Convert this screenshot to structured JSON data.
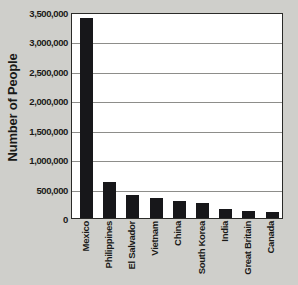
{
  "chart_data": {
    "type": "bar",
    "title": "",
    "xlabel": "",
    "ylabel": "Number of People",
    "categories": [
      "Mexico",
      "Philippines",
      "El Salvador",
      "Vietnam",
      "China",
      "South Korea",
      "India",
      "Great Britain",
      "Canada"
    ],
    "values": [
      3400000,
      620000,
      390000,
      335000,
      285000,
      250000,
      160000,
      115000,
      105000
    ],
    "ylim": [
      0,
      3500000
    ],
    "ytick_values": [
      0,
      500000,
      1000000,
      1500000,
      2000000,
      2500000,
      3000000,
      3500000
    ],
    "ytick_labels": [
      "0",
      "500,000",
      "1,000,000",
      "1,500,000",
      "2,000,000",
      "2,500,000",
      "3,000,000",
      "3,500,000"
    ],
    "grid": true,
    "legend": false,
    "bar_color": "#17171a",
    "plot_background": "#ffffff",
    "figure_background": "#cfcfcb",
    "gridline_color": "#8d8d8a",
    "axis_color": "#2a2a28"
  }
}
